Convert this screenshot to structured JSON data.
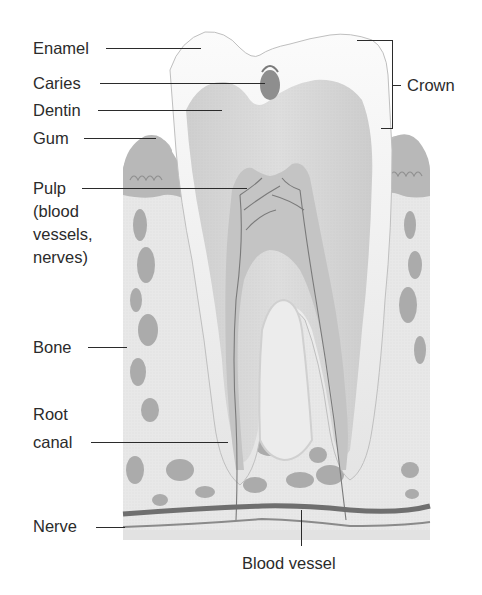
{
  "diagram": {
    "labels": {
      "enamel": "Enamel",
      "caries": "Caries",
      "dentin": "Dentin",
      "gum": "Gum",
      "pulp": [
        "Pulp",
        "(blood",
        "vessels,",
        "nerves)"
      ],
      "bone": "Bone",
      "root_canal": [
        "Root",
        "canal"
      ],
      "nerve": "Nerve",
      "crown": "Crown",
      "blood_vessel": "Blood vessel"
    },
    "colors": {
      "background": "#ffffff",
      "text": "#2b2b2b",
      "enamel": "#f2f2f2",
      "dentin": "#d6d6d6",
      "pulp": "#c4c4c4",
      "bone": "#e6e6e6",
      "bone_cavity": "#a9a9a9",
      "gum": "#b9b9b9",
      "vessel": "#6f6f6f"
    }
  }
}
